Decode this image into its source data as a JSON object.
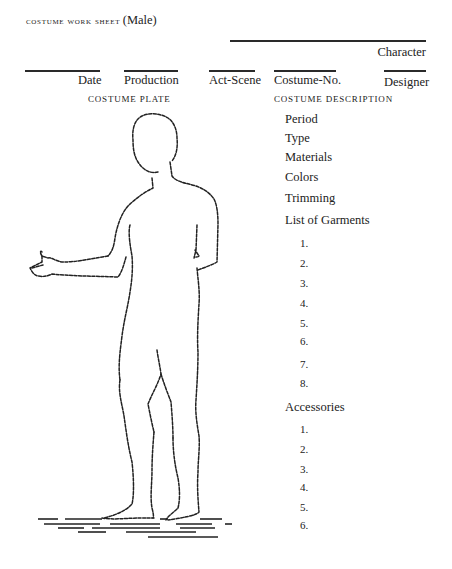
{
  "header": {
    "title": "costume work sheet",
    "subtitle": "(Male)",
    "character_label": "Character"
  },
  "fields": [
    {
      "label": "Date"
    },
    {
      "label": "Production"
    },
    {
      "label": "Act-Scene"
    },
    {
      "label": "Costume-No."
    },
    {
      "label": "Designer"
    }
  ],
  "sections": {
    "plate_label": "Costume Plate",
    "description_label": "Costume Description"
  },
  "description": {
    "attributes": [
      "Period",
      "Type",
      "Materials",
      "Colors",
      "Trimming"
    ],
    "garments_label": "List of Garments",
    "garments": [
      "1.",
      "2.",
      "3.",
      "4.",
      "5.",
      "6.",
      "7.",
      "8."
    ],
    "accessories_label": "Accessories",
    "accessories": [
      "1.",
      "2.",
      "3.",
      "4.",
      "5.",
      "6."
    ]
  },
  "colors": {
    "ink": "#222222",
    "paper": "#ffffff"
  }
}
